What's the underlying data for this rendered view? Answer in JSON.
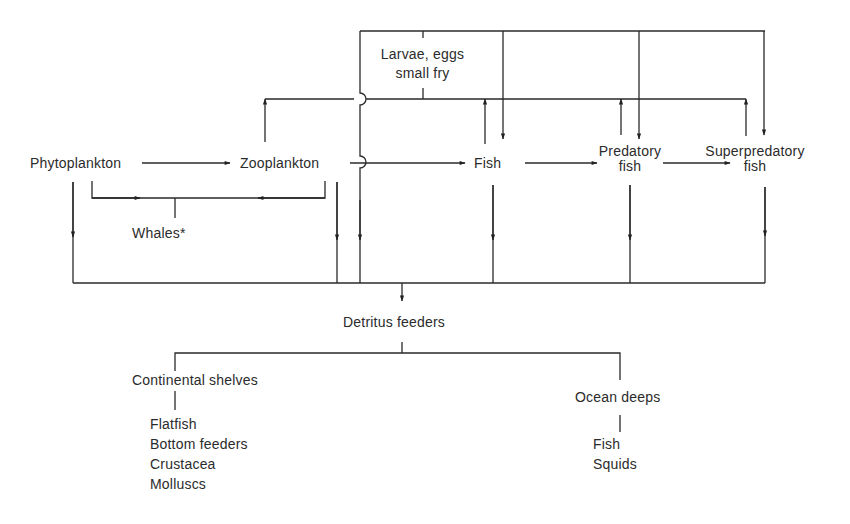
{
  "diagram": {
    "type": "marine food web flow diagram",
    "nodes": {
      "phytoplankton": "Phytoplankton",
      "zooplankton": "Zooplankton",
      "fish": "Fish",
      "predatory_fish_line1": "Predatory",
      "predatory_fish_line2": "fish",
      "superpredatory_fish_line1": "Superpredatory",
      "superpredatory_fish_line2": "fish",
      "larvae_line1": "Larvae, eggs",
      "larvae_line2": "small fry",
      "whales": "Whales*",
      "detritus_feeders": "Detritus feeders",
      "continental_shelves": "Continental shelves",
      "ocean_deeps": "Ocean deeps"
    },
    "continental_shelves_members": [
      "Flatfish",
      "Bottom feeders",
      "Crustacea",
      "Molluscs"
    ],
    "ocean_deeps_members": [
      "Fish",
      "Squids"
    ],
    "edges": [
      {
        "from": "Phytoplankton",
        "to": "Zooplankton"
      },
      {
        "from": "Zooplankton",
        "to": "Fish"
      },
      {
        "from": "Fish",
        "to": "Predatory fish"
      },
      {
        "from": "Predatory fish",
        "to": "Superpredatory fish"
      },
      {
        "from": "Phytoplankton",
        "to": "Whales*"
      },
      {
        "from": "Zooplankton",
        "to": "Whales*"
      },
      {
        "from": "Zooplankton",
        "to": "Larvae, eggs small fry"
      },
      {
        "from": "Fish",
        "to": "Larvae, eggs small fry"
      },
      {
        "from": "Predatory fish",
        "to": "Larvae, eggs small fry"
      },
      {
        "from": "Superpredatory fish",
        "to": "Larvae, eggs small fry"
      },
      {
        "from": "Larvae, eggs small fry",
        "to": "Fish"
      },
      {
        "from": "Larvae, eggs small fry",
        "to": "Predatory fish"
      },
      {
        "from": "Larvae, eggs small fry",
        "to": "Superpredatory fish"
      },
      {
        "from": "Larvae, eggs small fry",
        "to": "Detritus feeders"
      },
      {
        "from": "Phytoplankton",
        "to": "Detritus feeders"
      },
      {
        "from": "Zooplankton",
        "to": "Detritus feeders"
      },
      {
        "from": "Fish",
        "to": "Detritus feeders"
      },
      {
        "from": "Predatory fish",
        "to": "Detritus feeders"
      },
      {
        "from": "Superpredatory fish",
        "to": "Detritus feeders"
      },
      {
        "from": "Detritus feeders",
        "to": "Continental shelves"
      },
      {
        "from": "Detritus feeders",
        "to": "Ocean deeps"
      }
    ]
  }
}
